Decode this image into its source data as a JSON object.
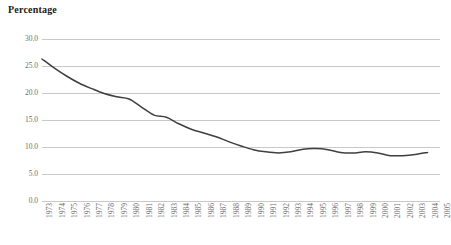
{
  "chart_data": {
    "type": "line",
    "title": "Percentage",
    "xlabel": "",
    "ylabel": "",
    "grid": true,
    "legend": false,
    "ylim": [
      0.0,
      30.0
    ],
    "ytick_labels": [
      "30.0",
      "25.0",
      "20.0",
      "15.0",
      "10.0",
      "5.0",
      "0.0"
    ],
    "ytick_values": [
      30.0,
      25.0,
      20.0,
      15.0,
      10.0,
      5.0,
      0.0
    ],
    "xlim": [
      "1973",
      "2005"
    ],
    "categories": [
      "1973",
      "1974",
      "1975",
      "1976",
      "1977",
      "1978",
      "1979",
      "1980",
      "1981",
      "1982",
      "1983",
      "1984",
      "1985",
      "1986",
      "1987",
      "1988",
      "1989",
      "1990",
      "1991",
      "1992",
      "1993",
      "1994",
      "1995",
      "1996",
      "1997",
      "1998",
      "1999",
      "2000",
      "2001",
      "2002",
      "2003",
      "2004",
      "2005"
    ],
    "series": [
      {
        "name": "Percentage",
        "color": "#3f3f3f",
        "values": [
          26.3,
          24.6,
          23.1,
          21.8,
          20.8,
          19.9,
          19.3,
          18.9,
          17.4,
          15.9,
          15.5,
          14.3,
          13.3,
          12.6,
          11.9,
          11.0,
          10.2,
          9.5,
          9.1,
          8.9,
          9.1,
          9.6,
          9.7,
          9.5,
          9.0,
          8.9,
          9.1,
          8.9,
          8.4,
          8.4,
          8.6,
          9.0,
          null
        ]
      }
    ]
  }
}
